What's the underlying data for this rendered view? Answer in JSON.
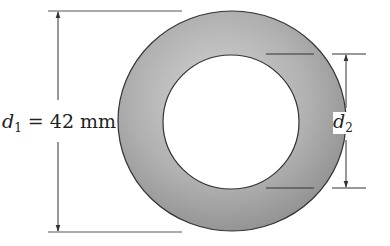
{
  "figure": {
    "type": "annular cross-section (hollow circular tube)",
    "outer_diameter": {
      "symbol": "d",
      "subscript": "1",
      "equals": "=",
      "value": "42 mm"
    },
    "inner_diameter": {
      "symbol": "d",
      "subscript": "2"
    },
    "colors": {
      "ring_fill": "#a8a8a8",
      "outline": "#333333",
      "background": "#ffffff"
    }
  }
}
